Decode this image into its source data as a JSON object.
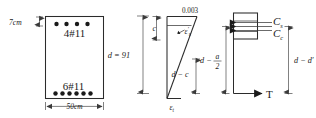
{
  "figure": {
    "section": {
      "name": "beam-cross-section",
      "cover_label": "7cm",
      "width_label": "50cm",
      "depth_label": "d = 91",
      "top_bars_label": "4#11",
      "bottom_bars_label": "6#11",
      "top_bars_count": 4,
      "bottom_bars_count": 6
    },
    "strain_diagram": {
      "name": "strain-distribution-diagram",
      "top_strain_label": "0.003",
      "neutral_axis_label": "c",
      "compression_steel_strain_label": "ε′s",
      "compression_steel_strain_base": "ε",
      "compression_steel_strain_sub": "s",
      "compression_steel_strain_prime": "′",
      "depth_minus_c_label": "d − c",
      "tension_strain_base": "ε",
      "tension_strain_sub": "t"
    },
    "force_diagram": {
      "name": "internal-force-diagram",
      "compression_steel_force_base": "C",
      "compression_steel_force_sub": "s",
      "concrete_force_base": "C",
      "concrete_force_sub": "c",
      "tension_force_label": "T",
      "lever_arm_label_base": "d −",
      "lever_arm_numerator": "a",
      "lever_arm_denominator": "2",
      "steel_lever_arm_label": "d − d′"
    },
    "colors": {
      "ink": "#1a1a1a",
      "line": "#2b2b2b",
      "dim_line": "#4a4a4a",
      "background": "#ffffff"
    }
  }
}
